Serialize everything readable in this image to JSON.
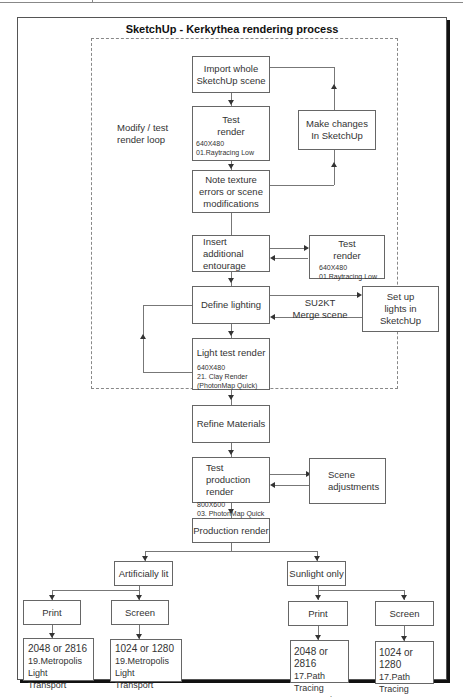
{
  "title": "SketchUp - Kerkythea rendering process",
  "loop": {
    "label_line1": "Modify / test",
    "label_line2": "render loop"
  },
  "nodes": {
    "import": {
      "line1": "Import whole",
      "line2": "SketchUp scene"
    },
    "test_render_1": {
      "line1": "Test",
      "line2": "render",
      "res": "640X480",
      "preset": "01.Raytracing Low"
    },
    "make_changes": {
      "line1": "Make changes",
      "line2": "In SketchUp"
    },
    "note_texture": {
      "line1": "Note texture",
      "line2": "errors or scene",
      "line3": "modifications"
    },
    "insert_entourage": {
      "line1": "Insert additional",
      "line2": "entourage"
    },
    "test_render_2": {
      "line1": "Test",
      "line2": "render",
      "res": "640X480",
      "preset": "01.Raytracing Low"
    },
    "define_lighting": {
      "line1": "Define lighting"
    },
    "set_up_lights": {
      "line1": "Set up",
      "line2": "lights in",
      "line3": "SketchUp"
    },
    "light_test": {
      "line1": "Light test render",
      "res": "640X480",
      "preset": "21. Clay Render",
      "preset2": "(PhotonMap Quick)"
    },
    "refine_materials": {
      "line1": "Refine Materials"
    },
    "test_production": {
      "line1": "Test production",
      "line2": "render",
      "res": "800X600",
      "preset": "03. PhotonMap Quick"
    },
    "scene_adjustments": {
      "line1": "Scene",
      "line2": "adjustments"
    },
    "production": {
      "line1": "Production render"
    },
    "artificially_lit": {
      "line1": "Artificially lit"
    },
    "sunlight_only": {
      "line1": "Sunlight only"
    },
    "art_print": {
      "line1": "Print"
    },
    "art_screen": {
      "line1": "Screen"
    },
    "sun_print": {
      "line1": "Print"
    },
    "sun_screen": {
      "line1": "Screen"
    },
    "art_print_out": {
      "line1": "2048 or 2816",
      "line2": "19.Metropolis Light",
      "line3": "Transport"
    },
    "art_screen_out": {
      "line1": "1024 or 1280",
      "line2": "19.Metropolis Light",
      "line3": "Transport"
    },
    "sun_print_out": {
      "line1": "2048 or 2816",
      "line2": "17.Path Tracing",
      "line3": "Progressive"
    },
    "sun_screen_out": {
      "line1": "1024 or 1280",
      "line2": "17.Path Tracing",
      "line3": "Progressive"
    }
  },
  "edges": {
    "su2kt_line1": "SU2KT",
    "su2kt_line2": "Merge scene"
  }
}
